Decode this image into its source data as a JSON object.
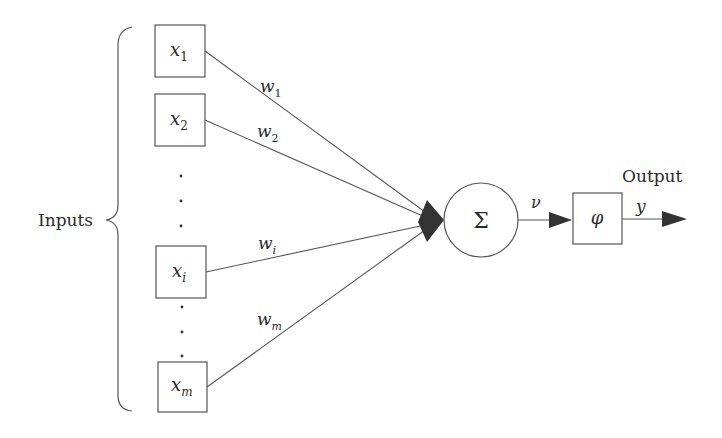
{
  "diagram": {
    "inputs_label": "Inputs",
    "output_label": "Output",
    "inputs": [
      {
        "name": "x",
        "sub": "1",
        "weight": "w",
        "weight_sub": "1"
      },
      {
        "name": "x",
        "sub": "2",
        "weight": "w",
        "weight_sub": "2"
      },
      {
        "name": "x",
        "sub": "i",
        "weight": "w",
        "weight_sub": "i"
      },
      {
        "name": "x",
        "sub": "m",
        "weight": "w",
        "weight_sub": "m"
      }
    ],
    "ellipsis": "⋮",
    "summation_symbol": "Σ",
    "induced_field_label": "ν",
    "activation_symbol": "φ",
    "output_symbol": "y",
    "colors": {
      "line": "#555555",
      "arrow": "#333333",
      "text": "#2a2a2a"
    }
  }
}
